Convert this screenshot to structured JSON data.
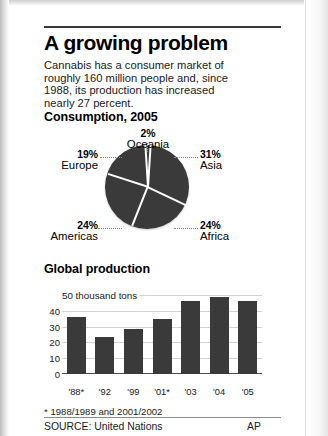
{
  "headline": "A growing problem",
  "deck": "Cannabis has a consumer market of roughly 160 million people and, since 1988, its production has increased nearly 27 percent.",
  "sections": {
    "consumption_heading": "Consumption, 2005",
    "production_heading": "Global production"
  },
  "footnote": "* 1988/1989 and 2001/2002",
  "footer": {
    "source": "SOURCE: United Nations",
    "credit": "AP"
  },
  "colors": {
    "ink": "#000000",
    "slice_fill": "#3a3a3a",
    "bar_fill": "#3a3a3a",
    "gridline": "#d2d2d2",
    "separator": "#ffffff",
    "page": "#ffffff"
  },
  "chart_data": [
    {
      "type": "pie",
      "title": "Consumption, 2005",
      "slices": [
        {
          "label": "Asia",
          "value": 31,
          "pct_text": "31%"
        },
        {
          "label": "Africa",
          "value": 24,
          "pct_text": "24%"
        },
        {
          "label": "Americas",
          "value": 24,
          "pct_text": "24%"
        },
        {
          "label": "Europe",
          "value": 19,
          "pct_text": "19%"
        },
        {
          "label": "Oceania",
          "value": 2,
          "pct_text": "2%"
        }
      ],
      "units": "percent",
      "legend": "labels placed around pie with dotted leader lines"
    },
    {
      "type": "bar",
      "title": "Global production",
      "categories": [
        "'88*",
        "'92",
        "'99",
        "'01*",
        "'03",
        "'04",
        "'05"
      ],
      "values": [
        36,
        23.5,
        28.5,
        35,
        46,
        49,
        46
      ],
      "xlabel": "",
      "ylabel": "50 thousand tons",
      "ytick_labels": [
        "50 thousand tons",
        "40",
        "30",
        "20",
        "10",
        "0"
      ],
      "ytick_values": [
        50,
        40,
        30,
        20,
        10,
        0
      ],
      "ylim": [
        0,
        52
      ],
      "grid": true,
      "legend": "none"
    }
  ]
}
